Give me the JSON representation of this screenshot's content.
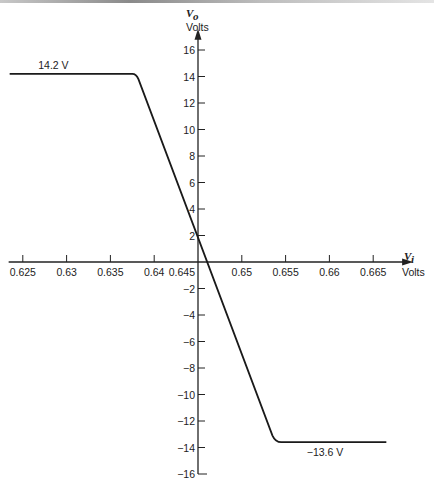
{
  "chart_data": {
    "type": "line",
    "title": "",
    "xlabel": {
      "symbol": "V",
      "subscript": "i",
      "unit": "Volts"
    },
    "ylabel": {
      "symbol": "V",
      "subscript": "o",
      "unit": "Volts"
    },
    "x_ticks": [
      "0.625",
      "0.63",
      "0.635",
      "0.64",
      "0.645",
      "0.65",
      "0.655",
      "0.66",
      "0.665"
    ],
    "x_tick_values": [
      0.625,
      0.63,
      0.635,
      0.64,
      0.645,
      0.65,
      0.655,
      0.66,
      0.665
    ],
    "y_ticks_positive": [
      "2",
      "4",
      "6",
      "8",
      "10",
      "12",
      "14",
      "16"
    ],
    "y_tick_values_positive": [
      2,
      4,
      6,
      8,
      10,
      12,
      14,
      16
    ],
    "y_ticks_negative": [
      "−2",
      "−4",
      "−6",
      "−8",
      "−10",
      "−12",
      "−14",
      "−16"
    ],
    "y_tick_values_negative": [
      -2,
      -4,
      -6,
      -8,
      -10,
      -12,
      -14,
      -16
    ],
    "xlim": [
      0.6235,
      0.6675
    ],
    "ylim": [
      -16,
      17
    ],
    "y_axis_at_x": 0.645,
    "grid": false,
    "series": [
      {
        "name": "transfer characteristic",
        "points": [
          [
            0.6235,
            14.2
          ],
          [
            0.6375,
            14.2
          ],
          [
            0.6382,
            13.8
          ],
          [
            0.6535,
            -13.1
          ],
          [
            0.6545,
            -13.6
          ],
          [
            0.6665,
            -13.6
          ]
        ]
      }
    ],
    "annotations": [
      {
        "text": "14.2 V",
        "x": 0.6285,
        "y": 14.2,
        "position": "above"
      },
      {
        "text": "−13.6 V",
        "x": 0.6595,
        "y": -13.6,
        "position": "below"
      }
    ]
  }
}
